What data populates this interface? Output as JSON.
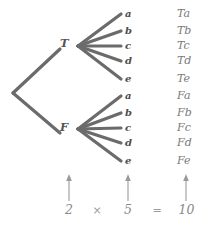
{
  "diagram": {
    "type": "probability-tree-diagram",
    "root_branches": [
      {
        "label": "T",
        "x": 66,
        "y": 45
      },
      {
        "label": "F",
        "x": 66,
        "y": 129
      }
    ],
    "leaf_labels": [
      "a",
      "b",
      "c",
      "d",
      "e"
    ],
    "leaf_group_top_y": [
      14,
      32,
      46,
      61,
      80
    ],
    "leaf_group_bottom_y": [
      96,
      113,
      128,
      143,
      161
    ],
    "outcomes_top": [
      "Ta",
      "Tb",
      "Tc",
      "Td",
      "Te"
    ],
    "outcomes_bottom": [
      "Fa",
      "Fb",
      "Fc",
      "Fd",
      "Fe"
    ],
    "equation": {
      "first_factor": "2",
      "multiply_sign": "×",
      "second_factor": "5",
      "equals_sign": "=",
      "product": "10"
    },
    "colors": {
      "line": "#6b6b6b",
      "arrow": "#9a9a9a",
      "text_dark": "#4d4d4d",
      "text_light": "#8a8a8a",
      "background": "#ffffff"
    }
  }
}
